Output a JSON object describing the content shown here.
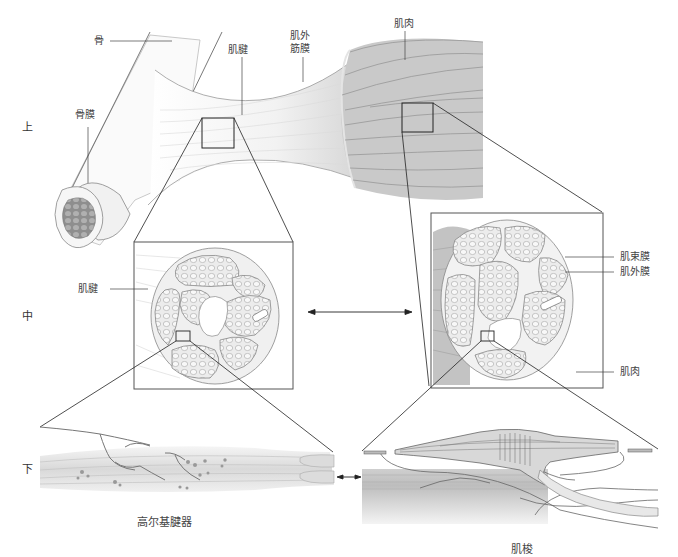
{
  "levels": {
    "top": "上",
    "middle": "中",
    "bottom": "下"
  },
  "labels": {
    "bone": "骨",
    "periosteum": "骨膜",
    "tendon_top": "肌腱",
    "epimysium_top": "肌外\n筋膜",
    "epimysium_top_line1": "肌外",
    "epimysium_top_line2": "筋膜",
    "muscle_top": "肌肉",
    "tendon_mid": "肌腱",
    "perimysium": "肌束膜",
    "epimysium_mid": "肌外膜",
    "muscle_mid": "肌肉"
  },
  "captions": {
    "golgi_tendon_organ": "高尔基腱器",
    "muscle_spindle": "肌梭"
  },
  "colors": {
    "line": "#333333",
    "muscle_fill": "#c8c8c8",
    "muscle_stripe": "#9a9a9a",
    "tendon_fill": "#f4f4f4",
    "fascicle_fill": "#ececec",
    "bone_marrow": "#a8a8a8"
  }
}
